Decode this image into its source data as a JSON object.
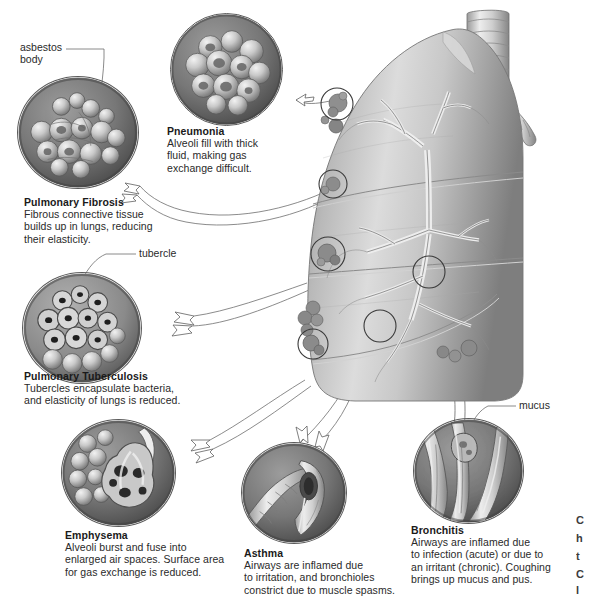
{
  "figure": {
    "style": "grayscale medical illustration"
  },
  "leader_labels": [
    {
      "id": "asbestos-body",
      "text_line1": "asbestos",
      "text_line2": "body"
    },
    {
      "id": "tubercle",
      "text": "tubercle"
    },
    {
      "id": "mucus",
      "text": "mucus"
    }
  ],
  "callouts": [
    {
      "id": "pneumonia",
      "title": "Pneumonia",
      "lines": [
        "Alveoli fill with thick",
        "fluid, making gas",
        "exchange difficult."
      ]
    },
    {
      "id": "pulmonary-fibrosis",
      "title": "Pulmonary Fibrosis",
      "lines": [
        "Fibrous connective tissue",
        "builds up in lungs, reducing",
        "their elasticity."
      ]
    },
    {
      "id": "pulmonary-tuberculosis",
      "title": "Pulmonary Tuberculosis",
      "lines": [
        "Tubercles encapsulate bacteria,",
        "and  elasticity of lungs is reduced."
      ]
    },
    {
      "id": "emphysema",
      "title": "Emphysema",
      "lines": [
        "Alveoli burst and fuse into",
        "enlarged air spaces. Surface area",
        "for gas exchange is reduced."
      ]
    },
    {
      "id": "asthma",
      "title": "Asthma",
      "lines": [
        "Airways are inflamed due",
        "to irritation, and bronchioles",
        "constrict due to muscle spasms."
      ]
    },
    {
      "id": "bronchitis",
      "title": "Bronchitis",
      "lines": [
        "Airways are inflamed due",
        "to infection (acute) or due to",
        "an irritant (chronic). Coughing",
        "brings  up mucus and pus."
      ]
    }
  ],
  "edge_clipped_text": [
    "C",
    "h",
    "t",
    "C",
    "l"
  ],
  "colors": {
    "page_background": "#ffffff",
    "text": "#231f20",
    "tissue_light": "#e6e6e6",
    "tissue_mid": "#b4b4b4",
    "tissue_dark": "#6e6e6e",
    "circle_rim": "#5b5b5b",
    "leader_line": "#6d6d6d"
  },
  "icon_names": [
    "detail-circle-icon",
    "arrow-callout-icon",
    "leader-line-icon",
    "lung-diagram-icon",
    "trachea-icon",
    "bronchial-tree-icon",
    "lesion-marker-icon"
  ]
}
